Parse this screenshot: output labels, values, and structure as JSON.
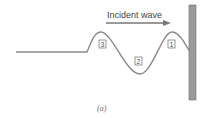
{
  "diagram": {
    "title": "Incident wave",
    "caption": "(a)",
    "markers": [
      {
        "label": "3",
        "x": 105,
        "y": 46
      },
      {
        "label": "2",
        "x": 139,
        "y": 62
      },
      {
        "label": "1",
        "x": 171,
        "y": 46
      }
    ],
    "colors": {
      "wave": "#8a8a8a",
      "wall": "#9a9a9a",
      "wall_border": "#6e6e6e",
      "arrow": "#777777"
    }
  }
}
